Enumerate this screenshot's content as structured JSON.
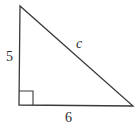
{
  "diagram": {
    "type": "right-triangle",
    "vertices": {
      "top": {
        "x": 20,
        "y": 6
      },
      "bottom_left": {
        "x": 19,
        "y": 105
      },
      "bottom_right": {
        "x": 133,
        "y": 106
      }
    },
    "right_angle_marker": {
      "x": 19,
      "y": 91,
      "size": 14
    },
    "labels": {
      "vertical_leg": "5",
      "horizontal_leg": "6",
      "hypotenuse": "c"
    },
    "colors": {
      "stroke": "#3a3a3a",
      "text": "#2a2a2a",
      "background": "#ffffff"
    }
  }
}
